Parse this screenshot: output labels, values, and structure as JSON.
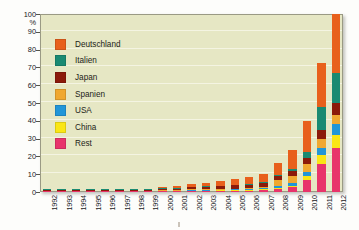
{
  "figure": {
    "background_color": "#fdfdfb",
    "plot_background_color": "#e6e7c4",
    "gridline_color": "#f4f4e2",
    "axis_color": "#55554a"
  },
  "y_axis": {
    "unit_label": "%",
    "ticks": [
      "0",
      "10",
      "20",
      "30",
      "40",
      "50",
      "60",
      "70",
      "80",
      "90",
      "100"
    ],
    "min": 0,
    "max": 100,
    "step": 10
  },
  "x_axis": {
    "ticks": [
      "1992",
      "1993",
      "1994",
      "1995",
      "1996",
      "1997",
      "1998",
      "1999",
      "2000",
      "2001",
      "2002",
      "2003",
      "2004",
      "2005",
      "2006",
      "2007",
      "2008",
      "2009",
      "2010",
      "2011",
      "2012"
    ]
  },
  "legend": {
    "items": [
      {
        "label": "Deutschland",
        "color": "#e8601c"
      },
      {
        "label": "Italien",
        "color": "#1a8a72"
      },
      {
        "label": "Japan",
        "color": "#8b1a0a"
      },
      {
        "label": "Spanien",
        "color": "#f0a830"
      },
      {
        "label": "USA",
        "color": "#2196d8"
      },
      {
        "label": "China",
        "color": "#fae615"
      },
      {
        "label": "Rest",
        "color": "#e8346b"
      }
    ]
  },
  "chart_data": {
    "type": "bar",
    "stacked": true,
    "title": "",
    "xlabel": "",
    "ylabel": "%",
    "ylim": [
      0,
      100
    ],
    "grid": true,
    "legend_position": "inside-upper-left",
    "categories": [
      "1992",
      "1993",
      "1994",
      "1995",
      "1996",
      "1997",
      "1998",
      "1999",
      "2000",
      "2001",
      "2002",
      "2003",
      "2004",
      "2005",
      "2006",
      "2007",
      "2008",
      "2009",
      "2010",
      "2011",
      "2012"
    ],
    "series": [
      {
        "name": "Rest",
        "color": "#e8346b",
        "values": [
          0.1,
          0.1,
          0.1,
          0.1,
          0.1,
          0.15,
          0.2,
          0.2,
          0.25,
          0.3,
          0.35,
          0.4,
          0.5,
          0.6,
          0.8,
          1.1,
          1.8,
          3.0,
          7.0,
          16.0,
          25.0
        ]
      },
      {
        "name": "China",
        "color": "#fae615",
        "values": [
          0,
          0,
          0,
          0,
          0,
          0,
          0,
          0,
          0,
          0,
          0.05,
          0.05,
          0.1,
          0.1,
          0.15,
          0.2,
          0.3,
          0.5,
          2.0,
          5.0,
          7.0
        ]
      },
      {
        "name": "USA",
        "color": "#2196d8",
        "values": [
          0.05,
          0.05,
          0.06,
          0.07,
          0.08,
          0.1,
          0.12,
          0.14,
          0.16,
          0.2,
          0.25,
          0.3,
          0.4,
          0.5,
          0.6,
          0.8,
          1.2,
          1.8,
          2.5,
          4.0,
          6.0
        ]
      },
      {
        "name": "Spanien",
        "color": "#f0a830",
        "values": [
          0,
          0,
          0,
          0,
          0,
          0,
          0,
          0,
          0.02,
          0.03,
          0.05,
          0.06,
          0.1,
          0.15,
          0.2,
          0.7,
          3.4,
          3.5,
          4.0,
          5.0,
          5.0
        ]
      },
      {
        "name": "Japan",
        "color": "#8b1a0a",
        "values": [
          0.05,
          0.06,
          0.08,
          0.1,
          0.12,
          0.2,
          0.3,
          0.4,
          0.55,
          0.75,
          1.0,
          1.2,
          1.5,
          1.8,
          2.0,
          2.2,
          2.4,
          2.8,
          3.5,
          5.0,
          7.0
        ]
      },
      {
        "name": "Italien",
        "color": "#1a8a72",
        "values": [
          0.01,
          0.01,
          0.02,
          0.02,
          0.02,
          0.03,
          0.03,
          0.04,
          0.05,
          0.06,
          0.07,
          0.08,
          0.1,
          0.12,
          0.15,
          0.2,
          0.5,
          1.2,
          3.5,
          13.0,
          17.0
        ]
      },
      {
        "name": "Deutschland",
        "color": "#e8601c",
        "values": [
          0.02,
          0.03,
          0.05,
          0.07,
          0.1,
          0.15,
          0.25,
          0.4,
          0.7,
          1.0,
          1.4,
          1.9,
          2.5,
          3.2,
          4.0,
          4.3,
          6.4,
          10.7,
          17.5,
          24.5,
          33.0
        ]
      }
    ],
    "totals": [
      0.23,
      0.25,
      0.31,
      0.36,
      0.42,
      0.63,
      0.9,
      1.18,
      1.73,
      2.34,
      3.17,
      3.99,
      5.2,
      6.47,
      7.9,
      9.5,
      16.0,
      23.5,
      40.0,
      72.5,
      100.0
    ]
  }
}
